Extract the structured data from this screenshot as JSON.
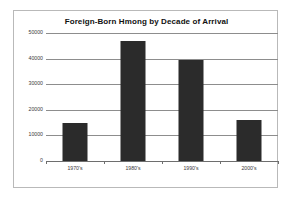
{
  "chart_data": {
    "type": "bar",
    "title": "Foreign-Born Hmong by Decade of Arrival",
    "xlabel": "",
    "ylabel": "",
    "categories": [
      "1970's",
      "1980's",
      "1990's",
      "2000's"
    ],
    "values": [
      15000,
      47000,
      39500,
      16000
    ],
    "series": [
      {
        "name": "Foreign-Born Hmong",
        "values": [
          15000,
          47000,
          39500,
          16000
        ]
      }
    ],
    "ylim": [
      0,
      50000
    ],
    "ytick_labels": [
      "0",
      "10000",
      "20000",
      "30000",
      "40000",
      "50000"
    ],
    "ytick_values": [
      0,
      10000,
      20000,
      30000,
      40000,
      50000
    ],
    "grid": true,
    "legend": false,
    "legend_position": "none",
    "bar_color": "#2b2b2b",
    "grid_color": "#8d8d8d",
    "border_color": "#b9b9b9",
    "background_color": "#ffffff",
    "title_color": "#111111",
    "tick_label_color": "#3a3a3a"
  }
}
